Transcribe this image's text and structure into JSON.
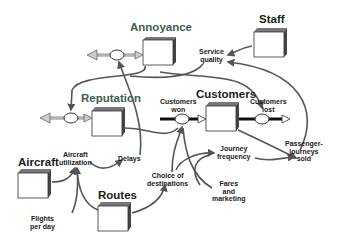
{
  "diagram": {
    "type": "stock-and-flow",
    "colors": {
      "green_title": "#3d5e4f",
      "black_title": "#1a1a1a",
      "arrow": "#555555",
      "stock_fill": "#ffffff",
      "stock_top": "#777777"
    },
    "stocks": [
      {
        "id": "annoyance",
        "label": "Annoyance",
        "color": "green"
      },
      {
        "id": "staff",
        "label": "Staff",
        "color": "black"
      },
      {
        "id": "reputation",
        "label": "Reputation",
        "color": "green"
      },
      {
        "id": "customers",
        "label": "Customers",
        "color": "black"
      },
      {
        "id": "aircraft",
        "label": "Aircraft",
        "color": "black"
      },
      {
        "id": "routes",
        "label": "Routes",
        "color": "black"
      }
    ],
    "variables": {
      "service_quality": "Service\nquality",
      "customers_won": "Customers\nwon",
      "customers_lost": "Customers\nlost",
      "aircraft_utilization": "Aircraft\nutilization",
      "delays": "Delays",
      "journey_frequency": "Journey\nfrequency",
      "passenger_journeys_sold": "Passenger-\njourneys\nsold",
      "choice_of_destinations": "Choice of\ndestinations",
      "fares_and_marketing": "Fares\nand\nmarketing",
      "flights_per_day": "Flights\nper day"
    }
  }
}
